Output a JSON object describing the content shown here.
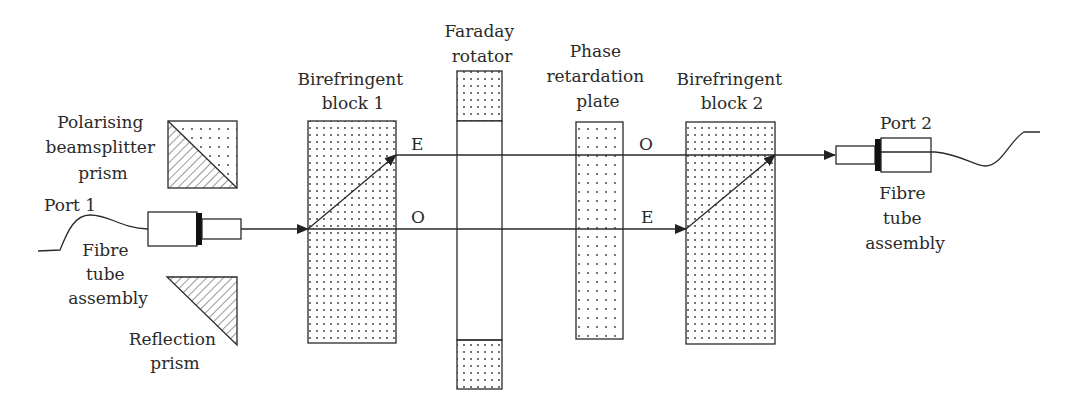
{
  "diagram": {
    "components": {
      "port1": {
        "label": "Port 1"
      },
      "fibre_left": {
        "label_lines": [
          "Fibre",
          "tube",
          "assembly"
        ]
      },
      "pbs": {
        "label_lines": [
          "Polarising",
          "beamsplitter",
          "prism"
        ]
      },
      "reflection": {
        "label_lines": [
          "Reflection",
          "prism"
        ]
      },
      "block1": {
        "label_lines": [
          "Birefringent",
          "block 1"
        ]
      },
      "faraday": {
        "label_lines": [
          "Faraday",
          "rotator"
        ]
      },
      "phase": {
        "label_lines": [
          "Phase",
          "retardation",
          "plate"
        ]
      },
      "block2": {
        "label_lines": [
          "Birefringent",
          "block 2"
        ]
      },
      "port2": {
        "label": "Port 2"
      },
      "fibre_right": {
        "label_lines": [
          "Fibre",
          "tube",
          "assembly"
        ]
      }
    },
    "beam_labels": {
      "upper_left": "E",
      "lower_left": "O",
      "upper_right": "O",
      "lower_right": "E"
    }
  }
}
